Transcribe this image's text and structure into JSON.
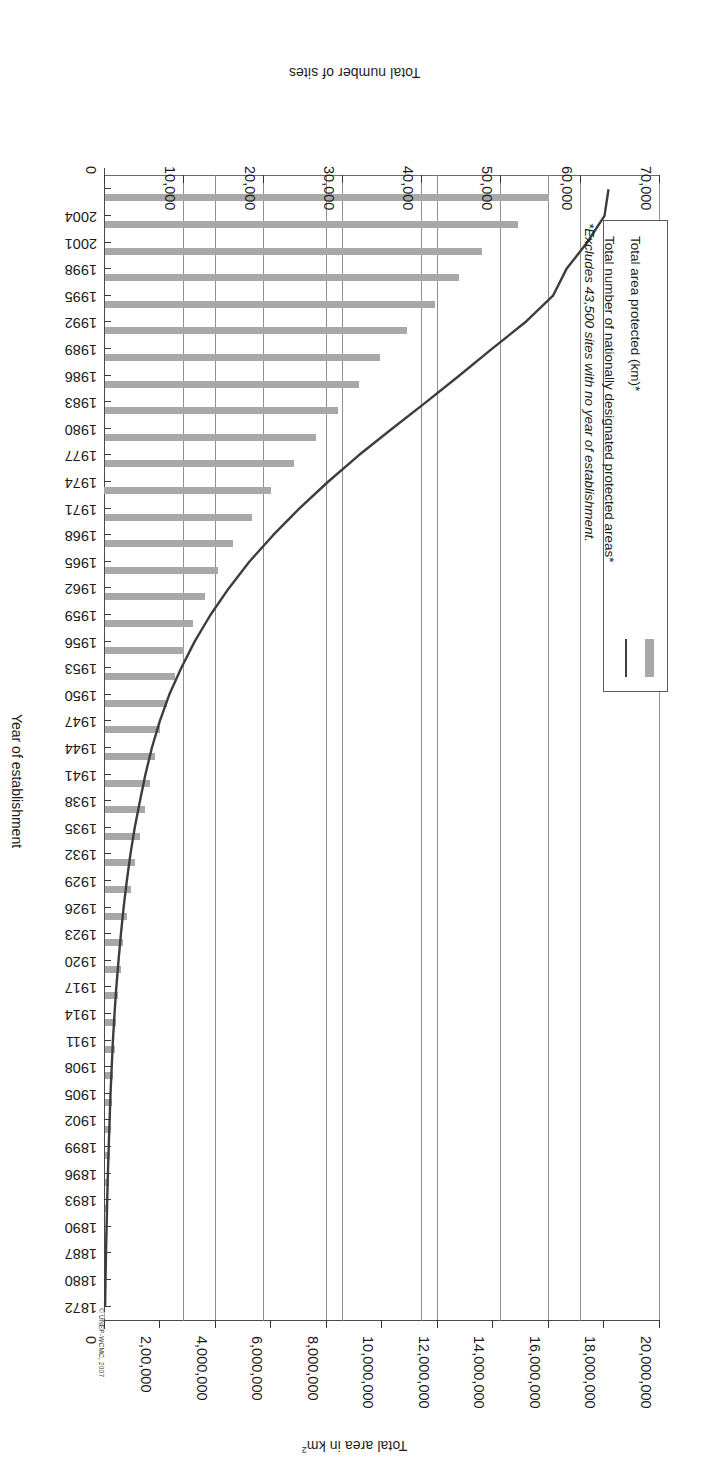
{
  "figure": {
    "source_credit": "© UNEP-WCMC, 2007",
    "bar_color": "#a8a8a8",
    "line_color": "#3d3d3d"
  },
  "legend": {
    "items": [
      {
        "label": "Total area protected (km)*",
        "marker": "bar-swatch"
      },
      {
        "label": "Total number of nationally designated protected areas*",
        "marker": "line-swatch"
      }
    ]
  },
  "footnote": "*Excludes 43,500 sites with no year of establishment.",
  "chart_data": {
    "type": "bar",
    "title": "",
    "orientation": "horizontal",
    "grid": true,
    "legend_position": "bottom-left",
    "xlabel": "Total area in km²",
    "xlabel_secondary": "Total number of sites",
    "ylabel": "Year of establishment",
    "xlim": [
      0,
      20000000
    ],
    "xlim_secondary": [
      0,
      70000
    ],
    "xticks": [
      "0",
      "2,00,000",
      "4,000,000",
      "6,000,000",
      "8,000,000",
      "10,000,000",
      "12,000,000",
      "14,000,000",
      "16,000,000",
      "18,000,000",
      "20,000,000"
    ],
    "xticks_secondary": [
      "0",
      "10,000",
      "20,000",
      "30,000",
      "40,000",
      "50,000",
      "60,000",
      "70,000"
    ],
    "categories": [
      1872,
      1880,
      1887,
      1890,
      1893,
      1896,
      1899,
      1902,
      1905,
      1908,
      1911,
      1914,
      1917,
      1920,
      1923,
      1926,
      1929,
      1932,
      1935,
      1938,
      1941,
      1944,
      1947,
      1950,
      1953,
      1956,
      1959,
      1962,
      1965,
      1968,
      1971,
      1974,
      1977,
      1980,
      1983,
      1986,
      1989,
      1992,
      1995,
      1998,
      2001,
      2004,
      2007
    ],
    "ytick_labels": [
      "1872",
      "1880",
      "1887",
      "1890",
      "1893",
      "1896",
      "1899",
      "1902",
      "1905",
      "1908",
      "1911",
      "1914",
      "1917",
      "1920",
      "1923",
      "1926",
      "1929",
      "1932",
      "1935",
      "1938",
      "1941",
      "1944",
      "1947",
      "1950",
      "1953",
      "1956",
      "1959",
      "1962",
      "1965",
      "1968",
      "1971",
      "1974",
      "1977",
      "1980",
      "1983",
      "1986",
      "1989",
      "1992",
      "1995",
      "1998",
      "2001",
      "2004"
    ],
    "series": [
      {
        "name": "Total area protected (km)*",
        "type": "bar",
        "axis": "primary",
        "unit": "km2",
        "values": [
          10000,
          30000,
          60000,
          90000,
          120000,
          150000,
          185000,
          220000,
          260000,
          300000,
          350000,
          400000,
          470000,
          560000,
          660000,
          790000,
          930000,
          1080000,
          1250000,
          1450000,
          1630000,
          1800000,
          1990000,
          2250000,
          2520000,
          2830000,
          3180000,
          3600000,
          4060000,
          4620000,
          5280000,
          6000000,
          6800000,
          7600000,
          8400000,
          9150000,
          9900000,
          10900000,
          11900000,
          12750000,
          13600000,
          14900000,
          16000000
        ]
      },
      {
        "name": "Total number of nationally designated protected areas*",
        "type": "line",
        "axis": "secondary",
        "unit": "sites",
        "values": [
          10,
          60,
          130,
          200,
          280,
          370,
          470,
          580,
          700,
          840,
          1000,
          1200,
          1430,
          1700,
          2000,
          2350,
          2750,
          3200,
          3750,
          4400,
          5100,
          5900,
          6900,
          8100,
          9600,
          11300,
          13300,
          15600,
          18200,
          21200,
          24500,
          28100,
          32000,
          36200,
          40500,
          44700,
          48800,
          53000,
          56500,
          58200,
          60800,
          63000,
          63500
        ]
      }
    ]
  }
}
